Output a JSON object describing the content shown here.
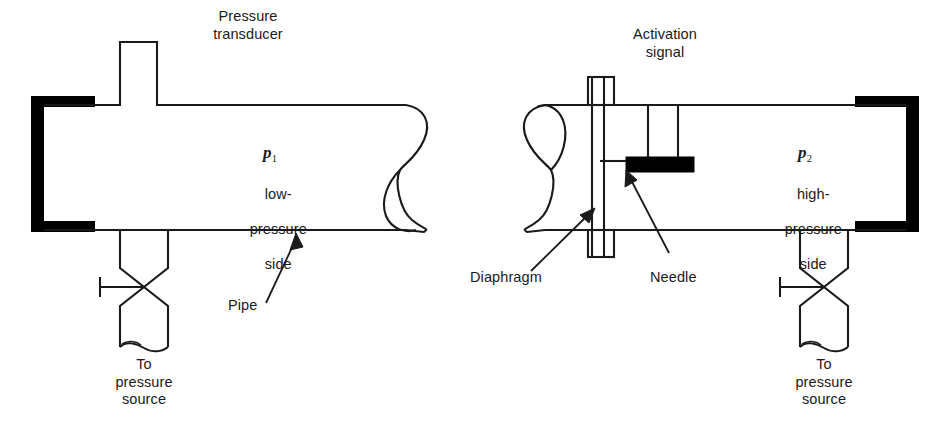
{
  "figure": {
    "type": "engineering-schematic",
    "stroke_color": "#1a1a1a",
    "fill_color": "#000000",
    "background": "#ffffff"
  },
  "left_assembly": {
    "transducer_label": "Pressure\ntransducer",
    "pressure_symbol": "p",
    "pressure_subscript": "1",
    "pressure_side_line1": "low-",
    "pressure_side_line2": "pressure",
    "pressure_side_line3": "side",
    "pipe_label": "Pipe",
    "source_label": "To\npressure\nsource"
  },
  "right_assembly": {
    "activation_label": "Activation\nsignal",
    "pressure_symbol": "p",
    "pressure_subscript": "2",
    "pressure_side_line1": "high-",
    "pressure_side_line2": "pressure",
    "pressure_side_line3": "side",
    "diaphragm_label": "Diaphragm",
    "needle_label": "Needle",
    "source_label": "To\npressure\nsource"
  }
}
